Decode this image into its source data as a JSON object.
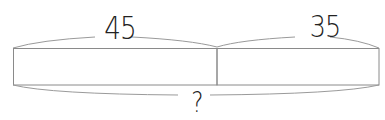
{
  "diagram": {
    "type": "tape-diagram",
    "segments": [
      {
        "label": "45",
        "value": 45
      },
      {
        "label": "35",
        "value": 35
      }
    ],
    "total": {
      "label": "?"
    },
    "colors": {
      "stroke": "#8a8a8a",
      "brace": "#9a9a9a",
      "text": "#222222",
      "background": "#ffffff"
    }
  }
}
